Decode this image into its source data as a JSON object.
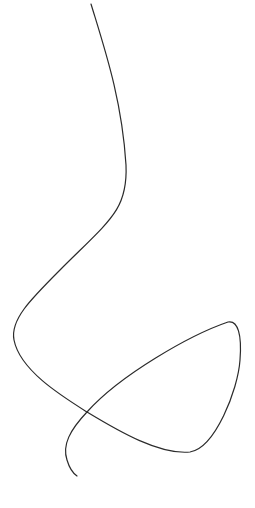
{
  "drawing": {
    "type": "freehand-curve",
    "stroke_color": "#2b2b2b",
    "background": "#ffffff",
    "path": "M 91 4 C 105 50, 122 100, 126 165 C 128 210, 110 220, 60 270 C 30 300, 10 320, 14 340 C 20 370, 60 395, 87 412 C 120 432, 160 455, 190 452 C 215 448, 238 390, 240 360 C 242 335, 238 320, 228 322 C 190 335, 120 375, 87 412 C 70 430, 62 445, 67 460 C 70 470, 74 474, 77 476"
  }
}
